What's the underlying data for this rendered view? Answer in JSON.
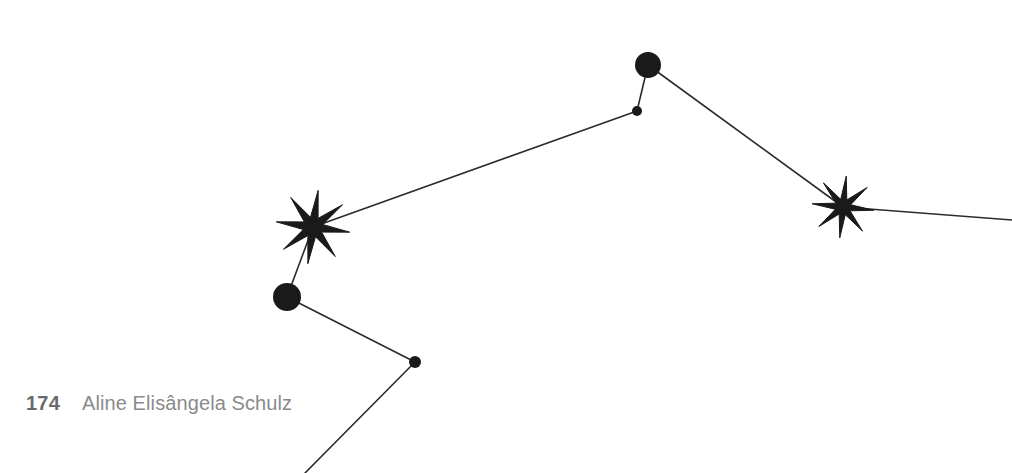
{
  "page": {
    "width": 1012,
    "height": 473,
    "background_color": "#ffffff"
  },
  "footer": {
    "folio": "174",
    "running_head": "Aline Elisângela Schulz",
    "folio_color": "#6a6a6c",
    "running_head_color": "#8a8a8c"
  },
  "figure": {
    "name": "constellation-diagram",
    "ink_color": "#1a1a1a",
    "line_color": "#2b2b2b",
    "line_width": 1.6,
    "nodes": [
      {
        "id": "star-left",
        "type": "star",
        "cx": 313,
        "cy": 227,
        "outer_r": 37,
        "inner_r": 10,
        "points": 8,
        "rotation": 8
      },
      {
        "id": "star-right",
        "type": "star",
        "cx": 843,
        "cy": 207,
        "outer_r": 31,
        "inner_r": 8,
        "points": 8,
        "rotation": 6
      },
      {
        "id": "dot-top-large",
        "type": "dot",
        "cx": 648,
        "cy": 65,
        "r": 13
      },
      {
        "id": "dot-top-small",
        "type": "dot",
        "cx": 637,
        "cy": 111,
        "r": 5
      },
      {
        "id": "dot-left-large",
        "type": "dot",
        "cx": 287,
        "cy": 297,
        "r": 14
      },
      {
        "id": "dot-lower-small",
        "type": "dot",
        "cx": 415,
        "cy": 362,
        "r": 6
      }
    ],
    "edges": [
      {
        "id": "edge-star-left-to-dot-top-small",
        "x1": 313,
        "y1": 227,
        "x2": 637,
        "y2": 111
      },
      {
        "id": "edge-dot-top-small-to-dot-top-large",
        "x1": 637,
        "y1": 111,
        "x2": 648,
        "y2": 65
      },
      {
        "id": "edge-dot-top-large-to-star-right",
        "x1": 648,
        "y1": 65,
        "x2": 843,
        "y2": 207
      },
      {
        "id": "edge-star-right-to-right-margin",
        "x1": 843,
        "y1": 207,
        "x2": 1012,
        "y2": 220
      },
      {
        "id": "edge-star-left-to-dot-left-large",
        "x1": 313,
        "y1": 227,
        "x2": 287,
        "y2": 297
      },
      {
        "id": "edge-dot-left-large-to-dot-lower-small",
        "x1": 287,
        "y1": 297,
        "x2": 415,
        "y2": 362
      },
      {
        "id": "edge-dot-lower-small-to-bottom-margin",
        "x1": 415,
        "y1": 362,
        "x2": 305,
        "y2": 473
      }
    ]
  }
}
